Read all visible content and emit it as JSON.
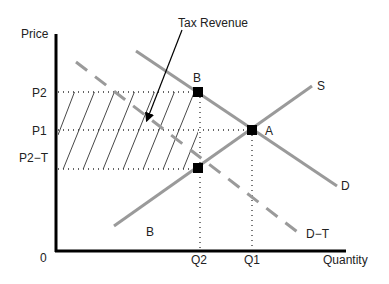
{
  "diagram": {
    "axes": {
      "y_label": "Price",
      "x_label": "Quantity",
      "origin_label": "0"
    },
    "price_ticks": [
      "P2",
      "P1",
      "P2−T"
    ],
    "quantity_ticks": [
      "Q2",
      "Q1"
    ],
    "curves": {
      "supply": "S",
      "demand": "D",
      "demand_minus_tax": "D−T"
    },
    "points": {
      "taxed_equilibrium": "B",
      "market_equilibrium": "A"
    },
    "region_labels": {
      "lower_region": "B"
    },
    "annotation": {
      "text": "Tax Revenue",
      "target": "hatched-tax-revenue-area"
    },
    "colors": {
      "axis": "#000000",
      "curve": "#9a9a9a",
      "guide_lines": "#333333",
      "points": "#000000"
    }
  }
}
